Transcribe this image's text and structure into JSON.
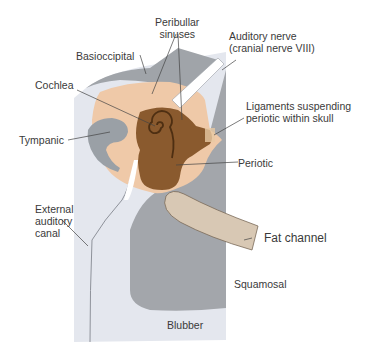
{
  "diagram": {
    "labels": {
      "peribullar_sinuses_line1": "Peribullar",
      "peribullar_sinuses_line2": "sinuses",
      "auditory_nerve_line1": "Auditory nerve",
      "auditory_nerve_line2": "(cranial nerve VIII)",
      "basioccipital": "Basioccipital",
      "cochlea": "Cochlea",
      "ligaments_line1": "Ligaments suspending",
      "ligaments_line2": "periotic within skull",
      "tympanic": "Tympanic",
      "periotic": "Periotic",
      "external_line1": "External",
      "external_line2": "auditory",
      "external_line3": "canal",
      "fat_channel": "Fat channel",
      "squamosal": "Squamosal",
      "blubber": "Blubber"
    },
    "colors": {
      "blubber": "#e4e7ee",
      "bone_gray": "#9fa3a8",
      "tissue_peach": "#efc9a8",
      "periotic_brown": "#8a5a2e",
      "periotic_dark": "#5e3a1a",
      "fat_channel": "#d8c8b4",
      "label_text": "#3a3a3a",
      "leader_line": "#444444"
    }
  }
}
